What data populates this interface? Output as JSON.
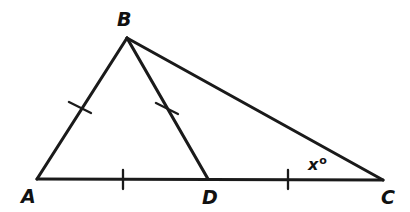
{
  "figure": {
    "kind": "geometry-diagram",
    "background_color": "#ffffff",
    "stroke_color": "#1a1a1a",
    "canvas": {
      "width": 410,
      "height": 212
    }
  },
  "points": {
    "A": {
      "label": "A",
      "x": 37,
      "y": 179,
      "label_x": 21,
      "label_y": 203
    },
    "B": {
      "label": "B",
      "x": 127,
      "y": 38,
      "label_x": 117,
      "label_y": 26
    },
    "C": {
      "label": "C",
      "x": 383,
      "y": 180,
      "label_x": 381,
      "label_y": 204
    },
    "D": {
      "label": "D",
      "x": 208,
      "y": 179,
      "label_x": 202,
      "label_y": 204
    }
  },
  "segments": [
    {
      "name": "side-AB",
      "from": "A",
      "to": "B",
      "x1": 37,
      "y1": 179,
      "x2": 127,
      "y2": 38,
      "ticks": 1
    },
    {
      "name": "side-BC",
      "from": "B",
      "to": "C",
      "x1": 127,
      "y1": 38,
      "x2": 383,
      "y2": 180,
      "ticks": 0
    },
    {
      "name": "base-AC",
      "from": "A",
      "to": "C",
      "x1": 37,
      "y1": 179,
      "x2": 383,
      "y2": 180,
      "ticks": 0
    },
    {
      "name": "cevian-BD",
      "from": "B",
      "to": "D",
      "x1": 127,
      "y1": 38,
      "x2": 208,
      "y2": 179,
      "ticks": 1
    }
  ],
  "tick_marks": [
    {
      "name": "tick-AB",
      "on_segment": "side-AB",
      "cx": 80,
      "cy": 107,
      "angle_deg": 57,
      "length": 20
    },
    {
      "name": "tick-BD",
      "on_segment": "cevian-BD",
      "cx": 167,
      "cy": 108,
      "angle_deg": 60,
      "length": 20
    },
    {
      "name": "tick-AD",
      "on_segment": "base-AD",
      "cx": 123,
      "cy": 179,
      "angle_deg": 0,
      "length": 19
    },
    {
      "name": "tick-DC",
      "on_segment": "base-DC",
      "cx": 288,
      "cy": 179,
      "angle_deg": 0,
      "length": 19
    }
  ],
  "angle_labels": [
    {
      "name": "angle-x-at-C",
      "text": "x",
      "superscript": "o",
      "x": 308,
      "y": 170,
      "at_vertex": "C"
    }
  ]
}
